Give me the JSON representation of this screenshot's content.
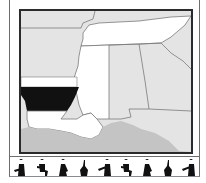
{
  "map": {
    "highlighted_state": "Arkansas",
    "colors": {
      "highlight": "#111111",
      "region_white": "#ffffff",
      "land_gray": "#e4e4e4",
      "water_gray": "#c4c4c4",
      "border": "#7a7a7a",
      "frame": "#2b2b2b"
    }
  },
  "musicians": [
    {
      "icon": "guitarist-silhouette-icon"
    },
    {
      "icon": "seated-guitarist-silhouette-icon"
    },
    {
      "icon": "guitarist-silhouette-icon"
    },
    {
      "icon": "upright-bass-silhouette-icon"
    },
    {
      "icon": "fiddler-silhouette-icon"
    },
    {
      "icon": "seated-guitarist-silhouette-icon"
    },
    {
      "icon": "guitarist-silhouette-icon"
    },
    {
      "icon": "upright-bass-silhouette-icon"
    },
    {
      "icon": "fiddler-silhouette-icon"
    }
  ]
}
